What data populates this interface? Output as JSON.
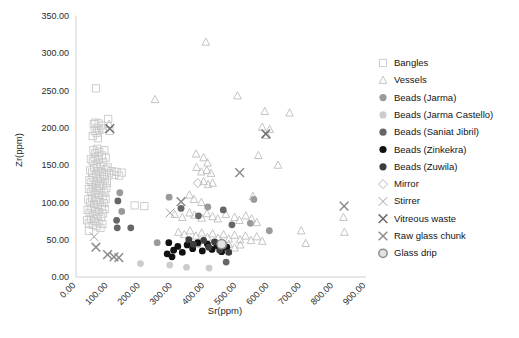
{
  "chart_data": {
    "type": "scatter",
    "title": "",
    "xlabel": "Sr(ppm)",
    "ylabel": "Zr(ppm)",
    "xlim": [
      0,
      900
    ],
    "ylim": [
      0,
      350
    ],
    "xticks": [
      "0.00",
      "100.00",
      "200.00",
      "300.00",
      "400.00",
      "500.00",
      "600.00",
      "700.00",
      "800.00",
      "900.00"
    ],
    "xtick_values": [
      0,
      100,
      200,
      300,
      400,
      500,
      600,
      700,
      800,
      900
    ],
    "yticks": [
      "0.00",
      "50.00",
      "100.00",
      "150.00",
      "200.00",
      "250.00",
      "300.00",
      "350.00"
    ],
    "ytick_values": [
      0,
      50,
      100,
      150,
      200,
      250,
      300,
      350
    ],
    "grid": false,
    "legend_position": "right",
    "series": [
      {
        "name": "Bangles",
        "marker": "square-open",
        "color": "#c9c9c9",
        "points": [
          [
            62,
            253
          ],
          [
            55,
            205
          ],
          [
            60,
            207
          ],
          [
            70,
            206
          ],
          [
            66,
            200
          ],
          [
            58,
            196
          ],
          [
            64,
            193
          ],
          [
            72,
            197
          ],
          [
            52,
            189
          ],
          [
            68,
            186
          ],
          [
            78,
            203
          ],
          [
            84,
            199
          ],
          [
            100,
            212
          ],
          [
            104,
            196
          ],
          [
            54,
            170
          ],
          [
            60,
            166
          ],
          [
            66,
            172
          ],
          [
            72,
            168
          ],
          [
            80,
            163
          ],
          [
            88,
            170
          ],
          [
            46,
            158
          ],
          [
            52,
            155
          ],
          [
            58,
            160
          ],
          [
            64,
            152
          ],
          [
            70,
            157
          ],
          [
            76,
            149
          ],
          [
            84,
            154
          ],
          [
            92,
            160
          ],
          [
            98,
            147
          ],
          [
            44,
            143
          ],
          [
            50,
            140
          ],
          [
            56,
            146
          ],
          [
            62,
            138
          ],
          [
            68,
            142
          ],
          [
            74,
            135
          ],
          [
            80,
            141
          ],
          [
            86,
            137
          ],
          [
            94,
            144
          ],
          [
            102,
            139
          ],
          [
            110,
            142
          ],
          [
            118,
            137
          ],
          [
            126,
            141
          ],
          [
            134,
            136
          ],
          [
            142,
            140
          ],
          [
            42,
            130
          ],
          [
            48,
            127
          ],
          [
            54,
            133
          ],
          [
            60,
            125
          ],
          [
            66,
            129
          ],
          [
            72,
            122
          ],
          [
            78,
            128
          ],
          [
            84,
            124
          ],
          [
            90,
            131
          ],
          [
            96,
            126
          ],
          [
            40,
            118
          ],
          [
            46,
            114
          ],
          [
            52,
            120
          ],
          [
            58,
            112
          ],
          [
            64,
            117
          ],
          [
            70,
            110
          ],
          [
            76,
            115
          ],
          [
            82,
            108
          ],
          [
            88,
            113
          ],
          [
            94,
            119
          ],
          [
            38,
            104
          ],
          [
            44,
            100
          ],
          [
            50,
            106
          ],
          [
            56,
            98
          ],
          [
            62,
            103
          ],
          [
            68,
            96
          ],
          [
            74,
            101
          ],
          [
            80,
            94
          ],
          [
            86,
            99
          ],
          [
            92,
            105
          ],
          [
            36,
            90
          ],
          [
            42,
            86
          ],
          [
            48,
            92
          ],
          [
            54,
            84
          ],
          [
            60,
            89
          ],
          [
            66,
            82
          ],
          [
            72,
            87
          ],
          [
            78,
            80
          ],
          [
            84,
            85
          ],
          [
            90,
            91
          ],
          [
            34,
            76
          ],
          [
            40,
            72
          ],
          [
            46,
            78
          ],
          [
            52,
            70
          ],
          [
            58,
            75
          ],
          [
            64,
            68
          ],
          [
            70,
            73
          ],
          [
            76,
            66
          ],
          [
            82,
            71
          ],
          [
            40,
            62
          ],
          [
            182,
            96
          ],
          [
            212,
            95
          ]
        ]
      },
      {
        "name": "Vessels",
        "marker": "triangle-open",
        "color": "#bdbdbd",
        "points": [
          [
            403,
            315
          ],
          [
            245,
            238
          ],
          [
            501,
            243
          ],
          [
            586,
            222
          ],
          [
            663,
            220
          ],
          [
            103,
            205
          ],
          [
            578,
            201
          ],
          [
            601,
            198
          ],
          [
            592,
            190
          ],
          [
            566,
            163
          ],
          [
            627,
            150
          ],
          [
            373,
            165
          ],
          [
            396,
            160
          ],
          [
            408,
            153
          ],
          [
            374,
            147
          ],
          [
            389,
            141
          ],
          [
            406,
            143
          ],
          [
            419,
            139
          ],
          [
            396,
            128
          ],
          [
            410,
            124
          ],
          [
            424,
            126
          ],
          [
            352,
            110
          ],
          [
            366,
            104
          ],
          [
            389,
            100
          ],
          [
            549,
            108
          ],
          [
            306,
            84
          ],
          [
            330,
            80
          ],
          [
            352,
            86
          ],
          [
            368,
            83
          ],
          [
            390,
            79
          ],
          [
            406,
            85
          ],
          [
            424,
            81
          ],
          [
            440,
            78
          ],
          [
            465,
            84
          ],
          [
            492,
            80
          ],
          [
            507,
            76
          ],
          [
            527,
            82
          ],
          [
            545,
            78
          ],
          [
            561,
            73
          ],
          [
            318,
            60
          ],
          [
            336,
            57
          ],
          [
            354,
            62
          ],
          [
            372,
            55
          ],
          [
            390,
            59
          ],
          [
            408,
            53
          ],
          [
            424,
            58
          ],
          [
            441,
            52
          ],
          [
            458,
            57
          ],
          [
            474,
            51
          ],
          [
            492,
            56
          ],
          [
            509,
            50
          ],
          [
            526,
            55
          ],
          [
            543,
            49
          ],
          [
            561,
            54
          ],
          [
            578,
            48
          ],
          [
            420,
            42
          ],
          [
            438,
            45
          ],
          [
            456,
            40
          ],
          [
            474,
            44
          ],
          [
            492,
            39
          ],
          [
            510,
            43
          ],
          [
            699,
            62
          ],
          [
            713,
            45
          ],
          [
            830,
            80
          ],
          [
            833,
            60
          ]
        ]
      },
      {
        "name": "Beads (Jarma)",
        "marker": "circle-filled",
        "color": "#9a9a9a",
        "points": [
          [
            136,
            113
          ],
          [
            142,
            88
          ],
          [
            289,
            107
          ],
          [
            409,
            94
          ],
          [
            552,
            104
          ],
          [
            541,
            72
          ],
          [
            600,
            62
          ],
          [
            252,
            46
          ],
          [
            379,
            44
          ]
        ]
      },
      {
        "name": "Beads (Jarma Castello)",
        "marker": "circle-filled",
        "color": "#cccccc",
        "points": [
          [
            343,
            13
          ],
          [
            413,
            12
          ],
          [
            200,
            18
          ],
          [
            291,
            16
          ],
          [
            455,
            46
          ]
        ]
      },
      {
        "name": "Beads (Saniat Jibril)",
        "marker": "circle-filled",
        "color": "#666666",
        "points": [
          [
            130,
            102
          ],
          [
            126,
            76
          ],
          [
            128,
            66
          ],
          [
            170,
            66
          ],
          [
            326,
            92
          ],
          [
            380,
            82
          ],
          [
            457,
            90
          ],
          [
            484,
            70
          ],
          [
            466,
            20
          ]
        ]
      },
      {
        "name": "Beads (Zinkekra)",
        "marker": "circle-filled",
        "color": "#111111",
        "points": [
          [
            288,
            46
          ],
          [
            303,
            36
          ],
          [
            316,
            41
          ],
          [
            330,
            33
          ],
          [
            345,
            43
          ],
          [
            362,
            38
          ],
          [
            378,
            46
          ],
          [
            392,
            35
          ],
          [
            408,
            44
          ],
          [
            422,
            37
          ],
          [
            438,
            42
          ],
          [
            452,
            34
          ],
          [
            468,
            40
          ],
          [
            283,
            31
          ],
          [
            298,
            27
          ]
        ]
      },
      {
        "name": "Beads (Zuwila)",
        "marker": "circle-filled",
        "color": "#3d3d3d",
        "points": [
          [
            350,
            50
          ],
          [
            364,
            44
          ],
          [
            396,
            49
          ],
          [
            412,
            40
          ],
          [
            430,
            47
          ],
          [
            446,
            36
          ],
          [
            460,
            42
          ],
          [
            474,
            33
          ]
        ]
      },
      {
        "name": "Mirror",
        "marker": "diamond-open",
        "color": "#b0b0b0",
        "points": [
          [
            378,
            126
          ]
        ]
      },
      {
        "name": "Stirrer",
        "marker": "x-thin",
        "color": "#9a9a9a",
        "points": [
          [
            292,
            86
          ],
          [
            56,
            54
          ]
        ]
      },
      {
        "name": "Vitreous waste",
        "marker": "x-bold",
        "color": "#6e6e6e",
        "points": [
          [
            589,
            192
          ],
          [
            105,
            199
          ]
        ]
      },
      {
        "name": "Raw glass chunk",
        "marker": "x-bold",
        "color": "#8c8c8c",
        "points": [
          [
            62,
            40
          ],
          [
            98,
            30
          ],
          [
            118,
            27
          ],
          [
            133,
            26
          ],
          [
            326,
            101
          ],
          [
            508,
            140
          ],
          [
            832,
            95
          ]
        ]
      },
      {
        "name": "Glass drip",
        "marker": "circle-open-thick",
        "color": "#b4b4b4",
        "points": [
          [
            452,
            44
          ]
        ]
      }
    ]
  },
  "legend": {
    "items": [
      {
        "label": "Bangles",
        "marker": "square-open",
        "color": "#c9c9c9"
      },
      {
        "label": "Vessels",
        "marker": "triangle-open",
        "color": "#bdbdbd"
      },
      {
        "label": "Beads (Jarma)",
        "marker": "circle-filled",
        "color": "#9a9a9a"
      },
      {
        "label": "Beads (Jarma Castello)",
        "marker": "circle-filled",
        "color": "#cccccc"
      },
      {
        "label": "Beads (Saniat Jibril)",
        "marker": "circle-filled",
        "color": "#666666"
      },
      {
        "label": "Beads (Zinkekra)",
        "marker": "circle-filled",
        "color": "#111111"
      },
      {
        "label": "Beads (Zuwila)",
        "marker": "circle-filled",
        "color": "#3d3d3d"
      },
      {
        "label": "Mirror",
        "marker": "diamond-open",
        "color": "#b0b0b0"
      },
      {
        "label": "Stirrer",
        "marker": "x-thin",
        "color": "#9a9a9a"
      },
      {
        "label": "Vitreous waste",
        "marker": "x-bold",
        "color": "#6e6e6e"
      },
      {
        "label": "Raw glass chunk",
        "marker": "x-bold",
        "color": "#8c8c8c"
      },
      {
        "label": "Glass drip",
        "marker": "circle-open-thick",
        "color": "#b4b4b4"
      }
    ]
  },
  "style": {
    "background": "#ffffff",
    "axis_color": "#cfcfcf",
    "text_color": "#2b2b2b"
  }
}
